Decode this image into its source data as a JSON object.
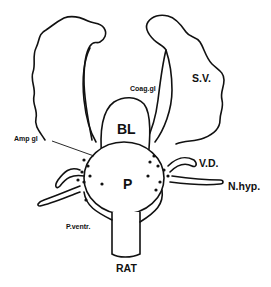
{
  "diagram": {
    "labels": {
      "seminal_vesicle": "S.V.",
      "coagulating_gland": "Coag.gl",
      "bladder": "BL",
      "ampullary_gland": "Amp gl",
      "prostate": "P",
      "vas_deferens": "V.D.",
      "hypogastric_nerve": "N.hyp.",
      "ventral_prostate": "P.ventr.",
      "species": "RAT"
    },
    "colors": {
      "ink": "#111111",
      "background": "#ffffff"
    }
  }
}
